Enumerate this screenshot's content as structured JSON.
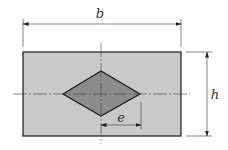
{
  "diagram": {
    "labels": {
      "width": "b",
      "height": "h",
      "eccentricity": "e"
    },
    "colors": {
      "outer_fill": "#c9c9c9",
      "inner_fill": "#8c8c8c",
      "stroke": "#1a1a1a",
      "centerline": "#444444",
      "dimension": "#333333",
      "background": "#ffffff"
    }
  }
}
